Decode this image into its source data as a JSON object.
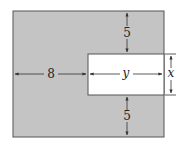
{
  "diagram": {
    "colors": {
      "region_fill": "#c4c4c4",
      "cutout_fill": "#ffffff",
      "stroke": "#555555",
      "arrow": "#333333"
    },
    "labels": {
      "left_width": "8",
      "cutout_width": "y",
      "cutout_height": "x",
      "top_margin": "5",
      "bottom_margin": "5"
    }
  }
}
